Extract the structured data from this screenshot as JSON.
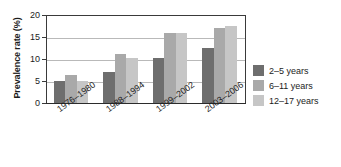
{
  "chart_data": {
    "type": "bar",
    "title": "",
    "subtitle": "",
    "xlabel": "",
    "ylabel": "Prevalence rate (%)",
    "ylim": [
      0,
      20
    ],
    "yticks": [
      0,
      5,
      10,
      15,
      20
    ],
    "ytick_labels": [
      "0",
      "5",
      "10",
      "15",
      "20"
    ],
    "grid": true,
    "grid_axis": "y",
    "legend_position": "right",
    "categories": [
      "1976–1980",
      "1988–1994",
      "1999–2002",
      "2003–2006"
    ],
    "series": [
      {
        "name": "2–5 years",
        "color": "#6e6e6e",
        "values": [
          5.0,
          7.0,
          10.2,
          12.4
        ]
      },
      {
        "name": "6–11 years",
        "color": "#a9a9a9",
        "values": [
          6.3,
          11.2,
          15.8,
          17.0
        ]
      },
      {
        "name": "12–17 years",
        "color": "#c6c6c6",
        "values": [
          5.0,
          10.3,
          16.0,
          17.6
        ]
      }
    ]
  },
  "legend": {
    "entries": [
      {
        "label": "2–5 years"
      },
      {
        "label": "6–11 years"
      },
      {
        "label": "12–17 years"
      }
    ]
  },
  "axes": {
    "y_title": "Prevalence rate (%)",
    "y_tick_labels": [
      "0",
      "5",
      "10",
      "15",
      "20"
    ],
    "x_tick_labels": [
      "1976–1980",
      "1988–1994",
      "1999–2002",
      "2003–2006"
    ]
  },
  "colors": {
    "series_1": "#6e6e6e",
    "series_2": "#a9a9a9",
    "series_3": "#c6c6c6",
    "axis": "#2b2b2b",
    "grid": "#b9b9b9",
    "background": "#ffffff"
  }
}
